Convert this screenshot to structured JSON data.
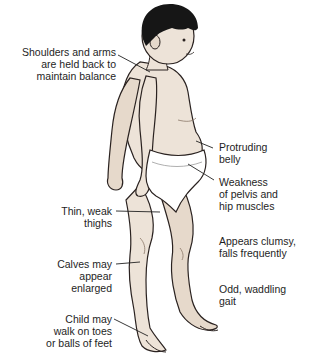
{
  "diagram": {
    "colors": {
      "skin": "#ede3d8",
      "skin_shadow": "#d9c9b8",
      "hair": "#161616",
      "outline": "#2a2220",
      "underwear": "#ffffff",
      "leader_line": "#222222",
      "text": "#1e1e1e"
    },
    "labels_left": [
      {
        "id": "shoulders",
        "lines": [
          "Shoulders and arms",
          "are held back to",
          "maintain balance"
        ]
      },
      {
        "id": "thighs",
        "lines": [
          "Thin, weak",
          "thighs"
        ]
      },
      {
        "id": "calves",
        "lines": [
          "Calves may",
          "appear",
          "enlarged"
        ]
      },
      {
        "id": "toes",
        "lines": [
          "Child may",
          "walk on toes",
          "or balls of feet"
        ]
      }
    ],
    "labels_right": [
      {
        "id": "belly",
        "lines": [
          "Protruding",
          "belly"
        ]
      },
      {
        "id": "pelvis",
        "lines": [
          "Weakness",
          "of pelvis and",
          "hip muscles"
        ]
      },
      {
        "id": "clumsy",
        "lines": [
          "Appears clumsy,",
          "falls frequently"
        ]
      },
      {
        "id": "gait",
        "lines": [
          "Odd, waddling",
          "gait"
        ]
      }
    ]
  }
}
